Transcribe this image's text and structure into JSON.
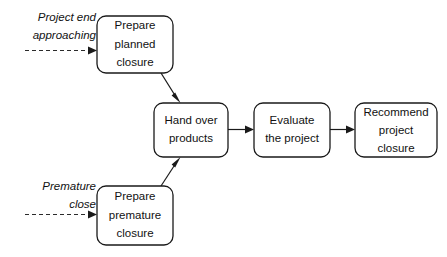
{
  "diagram": {
    "background_color": "#ffffff",
    "line_color": "#1a1a1a",
    "text_color": "#111111",
    "nodes": [
      {
        "id": "prepare-planned-closure",
        "lines": [
          "Prepare",
          "planned",
          "closure"
        ],
        "x": 97,
        "y": 16,
        "w": 76,
        "h": 57
      },
      {
        "id": "prepare-premature-closure",
        "lines": [
          "Prepare",
          "premature",
          "closure"
        ],
        "x": 97,
        "y": 186,
        "w": 76,
        "h": 59
      },
      {
        "id": "hand-over-products",
        "lines": [
          "Hand over",
          "products"
        ],
        "x": 154,
        "y": 103,
        "w": 74,
        "h": 54
      },
      {
        "id": "evaluate-the-project",
        "lines": [
          "Evaluate",
          "the project"
        ],
        "x": 254,
        "y": 103,
        "w": 76,
        "h": 54
      },
      {
        "id": "recommend-project-closure",
        "lines": [
          "Recommend",
          "project",
          "closure"
        ],
        "x": 355,
        "y": 103,
        "w": 82,
        "h": 54
      }
    ],
    "trigger_labels": [
      {
        "id": "project-end-approaching",
        "lines": [
          "Project end",
          "approaching"
        ],
        "anchor_x": 96,
        "line1_y": 21,
        "line2_y": 39,
        "align": "end"
      },
      {
        "id": "premature-close",
        "lines": [
          "Premature",
          "close"
        ],
        "anchor_x": 96,
        "line1_y": 190,
        "line2_y": 208,
        "align": "end"
      }
    ],
    "edges": [
      {
        "id": "trigger-to-planned",
        "style": "dashed",
        "from": "project-end-approaching",
        "to": "prepare-planned-closure"
      },
      {
        "id": "trigger-to-premature",
        "style": "dashed",
        "from": "premature-close",
        "to": "prepare-premature-closure"
      },
      {
        "id": "planned-to-handover",
        "style": "solid",
        "from": "prepare-planned-closure",
        "to": "hand-over-products"
      },
      {
        "id": "premature-to-handover",
        "style": "solid",
        "from": "prepare-premature-closure",
        "to": "hand-over-products"
      },
      {
        "id": "handover-to-evaluate",
        "style": "solid",
        "from": "hand-over-products",
        "to": "evaluate-the-project"
      },
      {
        "id": "evaluate-to-recommend",
        "style": "solid",
        "from": "evaluate-the-project",
        "to": "recommend-project-closure"
      }
    ]
  }
}
